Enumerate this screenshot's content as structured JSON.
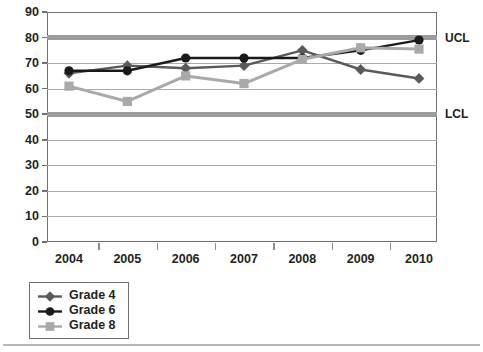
{
  "chart_data": {
    "type": "line",
    "title": "",
    "subtitle": "",
    "xlabel": "",
    "ylabel": "",
    "categories": [
      "2004",
      "2005",
      "2006",
      "2007",
      "2008",
      "2009",
      "2010"
    ],
    "x": [
      2004,
      2005,
      2006,
      2007,
      2008,
      2009,
      2010
    ],
    "xlim": [
      2004,
      2010
    ],
    "ylim": [
      0,
      90
    ],
    "y_ticks": [
      0,
      10,
      20,
      30,
      40,
      50,
      60,
      70,
      80,
      90
    ],
    "y_tick_labels": [
      "0",
      "10",
      "20",
      "30",
      "40",
      "50",
      "60",
      "70",
      "80",
      "90"
    ],
    "grid": "horizontal",
    "legend_position": "below-left",
    "series": [
      {
        "name": "Grade 4",
        "color": "#595a5c",
        "marker": "diamond",
        "values": [
          66,
          69,
          68,
          69,
          75,
          67.5,
          64
        ]
      },
      {
        "name": "Grade 6",
        "color": "#1a1a1a",
        "marker": "circle",
        "values": [
          67,
          67,
          72,
          72,
          72,
          75,
          79
        ]
      },
      {
        "name": "Grade 8",
        "color": "#a7a9ab",
        "marker": "square",
        "values": [
          61,
          55,
          65,
          62,
          71.5,
          76,
          75.5
        ]
      }
    ],
    "reference_lines": [
      {
        "label": "UCL",
        "value": 80,
        "color": "#9b9c9e"
      },
      {
        "label": "LCL",
        "value": 50,
        "color": "#9b9c9e"
      }
    ]
  },
  "legend": {
    "items": [
      {
        "label": "Grade 4"
      },
      {
        "label": "Grade 6"
      },
      {
        "label": "Grade 8"
      }
    ]
  }
}
